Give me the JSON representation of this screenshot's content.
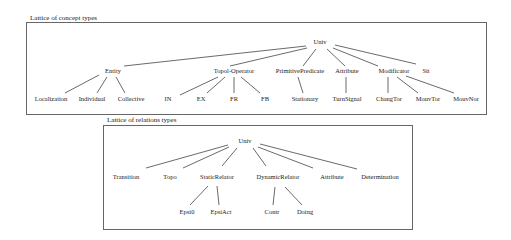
{
  "concept_lattice": {
    "caption": "Lattice of concept types",
    "root": "Univ",
    "level1": [
      "Entity",
      "Topol-Operator",
      "PrimitivePredicate",
      "Attribute",
      "Modificator",
      "Sit"
    ],
    "level2": [
      "Localization",
      "Individual",
      "Collective",
      "IN",
      "EX",
      "FR",
      "FB",
      "Stationary",
      "TurnSignal",
      "ChangTor",
      "MouvTor",
      "MouvNor"
    ],
    "edges": [
      [
        "Univ",
        "Entity"
      ],
      [
        "Univ",
        "Topol-Operator"
      ],
      [
        "Univ",
        "PrimitivePredicate"
      ],
      [
        "Univ",
        "Attribute"
      ],
      [
        "Univ",
        "Modificator"
      ],
      [
        "Univ",
        "Sit"
      ],
      [
        "Entity",
        "Localization"
      ],
      [
        "Entity",
        "Individual"
      ],
      [
        "Entity",
        "Collective"
      ],
      [
        "Topol-Operator",
        "IN"
      ],
      [
        "Topol-Operator",
        "EX"
      ],
      [
        "Topol-Operator",
        "FR"
      ],
      [
        "Topol-Operator",
        "FB"
      ],
      [
        "PrimitivePredicate",
        "Stationary"
      ],
      [
        "Attribute",
        "TurnSignal"
      ],
      [
        "Modificator",
        "ChangTor"
      ],
      [
        "Modificator",
        "MouvTor"
      ],
      [
        "Modificator",
        "MouvNor"
      ]
    ]
  },
  "relation_lattice": {
    "caption": "Lattice of relations types",
    "root": "Univ",
    "level1": [
      "Transition",
      "Topo",
      "StaticRelator",
      "DynamicRelator",
      "Attribute",
      "Determination"
    ],
    "level2": [
      "Epsi0",
      "EpsiAct",
      "Contr",
      "Doing"
    ],
    "edges": [
      [
        "Univ",
        "Transition"
      ],
      [
        "Univ",
        "Topo"
      ],
      [
        "Univ",
        "StaticRelator"
      ],
      [
        "Univ",
        "DynamicRelator"
      ],
      [
        "Univ",
        "Attribute"
      ],
      [
        "Univ",
        "Determination"
      ],
      [
        "StaticRelator",
        "Epsi0"
      ],
      [
        "StaticRelator",
        "EpsiAct"
      ],
      [
        "DynamicRelator",
        "Contr"
      ],
      [
        "DynamicRelator",
        "Doing"
      ]
    ]
  }
}
